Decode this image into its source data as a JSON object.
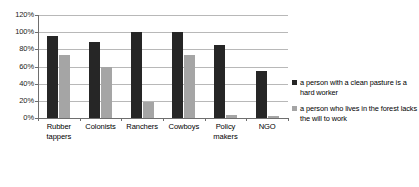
{
  "chart_data": {
    "type": "bar",
    "title": "",
    "xlabel": "",
    "ylabel": "",
    "ylim": [
      0,
      120
    ],
    "ytick_labels": [
      "120%",
      "100%",
      "80%",
      "60%",
      "40%",
      "20%",
      "0%"
    ],
    "ytick_values": [
      120,
      100,
      80,
      60,
      40,
      20,
      0
    ],
    "grid": true,
    "legend_position": "right",
    "categories": [
      "Rubber tappers",
      "Colonists",
      "Ranchers",
      "Cowboys",
      "Policy makers",
      "NGO"
    ],
    "category_lines": [
      [
        "Rubber",
        "tappers"
      ],
      [
        "Colonists"
      ],
      [
        "Ranchers"
      ],
      [
        "Cowboys"
      ],
      [
        "Policy",
        "makers"
      ],
      [
        "NGO"
      ]
    ],
    "series": [
      {
        "name": "a person with a clean pasture is a hard worker",
        "color": "#262626",
        "values": [
          95,
          89,
          100,
          100,
          85,
          55
        ]
      },
      {
        "name": "a person who lives in the forest lacks the will to work",
        "color": "#a5a5a5",
        "values": [
          73,
          59,
          19,
          73,
          3,
          2
        ]
      }
    ]
  },
  "legend": {
    "items": [
      {
        "label": "a person with a clean pasture is a hard worker",
        "color": "#262626"
      },
      {
        "label": "a person who lives in the forest lacks the will to work",
        "color": "#a5a5a5"
      }
    ]
  }
}
